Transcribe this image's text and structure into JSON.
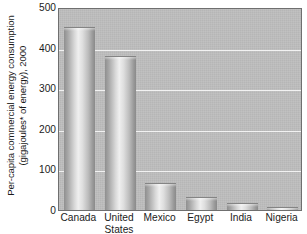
{
  "chart_data": {
    "type": "bar",
    "title": "",
    "subtitle": "",
    "xlabel": "",
    "ylabel_lines": [
      "Per-capita commercial energy consumption",
      "(gigajoules* of energy), 2000"
    ],
    "ylabel": "Per-capita commercial energy consumption (gigajoules* of energy), 2000",
    "categories": [
      "Canada",
      "United States",
      "Mexico",
      "Egypt",
      "India",
      "Nigeria"
    ],
    "category_lines": [
      [
        "Canada",
        ""
      ],
      [
        "United",
        "States"
      ],
      [
        "Mexico",
        ""
      ],
      [
        "Egypt",
        ""
      ],
      [
        "India",
        ""
      ],
      [
        "Nigeria",
        ""
      ]
    ],
    "values": [
      450,
      380,
      66,
      33,
      17,
      7
    ],
    "ylim": [
      0,
      500
    ],
    "ytick_values": [
      0,
      100,
      200,
      300,
      400,
      500
    ],
    "ytick_labels": [
      "0",
      "100",
      "200",
      "300",
      "400",
      "500"
    ],
    "grid": true,
    "grid_axis": "y",
    "legend": "none",
    "legend_position": "none",
    "units": "gigajoules per capita",
    "footnote_marker": "*"
  },
  "style": {
    "plot_background": "#bdbdbd",
    "plot_border": "#6f6f6f",
    "gridline_color": "#f2f2f2",
    "bar_light": "#efefef",
    "bar_mid": "#bcbcbc",
    "bar_dark": "#8a8a8a",
    "text_color": "#1b1b1b",
    "page_background": "#ffffff"
  }
}
